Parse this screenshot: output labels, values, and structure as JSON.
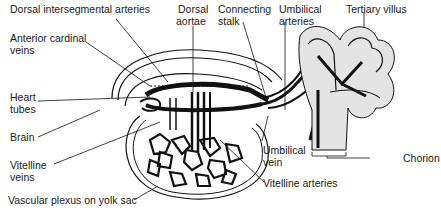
{
  "diagram": {
    "labels": {
      "dorsal_intersegmental_arteries": "Dorsal intersegmental arteries",
      "dorsal_aortae_1": "Dorsal",
      "dorsal_aortae_2": "aortae",
      "connecting_stalk_1": "Connecting",
      "connecting_stalk_2": "stalk",
      "umbilical_arteries_1": "Umbilical",
      "umbilical_arteries_2": "arteries",
      "tertiary_villus": "Tertiary villus",
      "anterior_cardinal_veins_1": "Anterior cardinal",
      "anterior_cardinal_veins_2": "veins",
      "heart_tubes_1": "Heart",
      "heart_tubes_2": "tubes",
      "brain": "Brain",
      "vitelline_veins_1": "Vitelline",
      "vitelline_veins_2": "veins",
      "vascular_plexus": "Vascular plexus on yolk sac",
      "umbilical_vein_1": "Umbilical",
      "umbilical_vein_2": "vein",
      "vitelline_arteries": "Vitelline arteries",
      "chorion": "Chorion"
    },
    "colors": {
      "ink": "#111111",
      "stipple": "#d8d8d8",
      "background": "#ffffff"
    }
  }
}
